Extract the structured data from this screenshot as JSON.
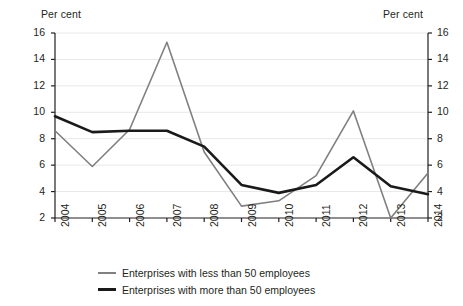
{
  "chart_data": {
    "type": "line",
    "title": "",
    "subtitle": "",
    "xlabel": "",
    "ylabel": "Per cent",
    "ylabel_right": "Per cent",
    "unit_label_left": "Per cent",
    "unit_label_right": "Per cent",
    "categories": [
      "2004",
      "2005",
      "2006",
      "2007",
      "2008",
      "2009",
      "2010",
      "2011",
      "2012",
      "2013",
      "2014"
    ],
    "x": [
      2004,
      2005,
      2006,
      2007,
      2008,
      2009,
      2010,
      2011,
      2012,
      2013,
      2014
    ],
    "ylim": [
      2,
      16
    ],
    "yticks": [
      2,
      4,
      6,
      8,
      10,
      12,
      14,
      16
    ],
    "ytick_labels": [
      "2",
      "4",
      "6",
      "8",
      "10",
      "12",
      "14",
      "16"
    ],
    "grid": true,
    "grid_axis": "y",
    "legend_position": "bottom",
    "series": [
      {
        "name": "Enterprises with less than 50 employees",
        "color": "#808080",
        "width": 1.6,
        "values": [
          8.6,
          5.9,
          8.7,
          15.3,
          7.0,
          2.9,
          3.3,
          5.2,
          10.1,
          2.0,
          5.4
        ]
      },
      {
        "name": "Enterprises with more than 50 employees",
        "color": "#1a1a1a",
        "width": 2.6,
        "values": [
          9.7,
          8.5,
          8.6,
          8.6,
          7.4,
          4.5,
          3.9,
          4.5,
          6.6,
          4.4,
          3.8
        ]
      }
    ]
  },
  "legend": {
    "items": [
      {
        "label": "Enterprises with less than 50 employees",
        "swatch": "series-a"
      },
      {
        "label": "Enterprises with more than 50 employees",
        "swatch": "series-b"
      }
    ]
  },
  "colors": {
    "series_a": "#808080",
    "series_b": "#1a1a1a",
    "axis": "#231f20",
    "grid": "#e8e8ea",
    "background": "#ffffff"
  }
}
